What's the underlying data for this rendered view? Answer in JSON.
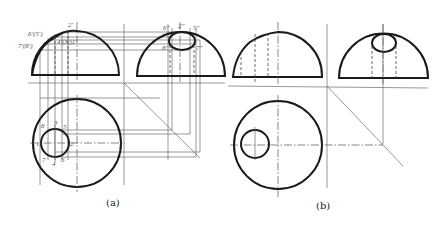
{
  "figure": {
    "panels": [
      {
        "id": "a",
        "caption": "(a)",
        "front_view_labels": [
          "6'(5')",
          "7'(8')",
          "2'",
          "4'",
          "3'",
          "1'"
        ],
        "side_view_labels": [
          "6\"",
          "2\"",
          "5\"",
          "7\"",
          "8\"",
          "4\"",
          "1\"",
          "3\""
        ],
        "top_view_labels": [
          "8",
          "3",
          "5",
          "1",
          "2",
          "7",
          "4",
          "6"
        ]
      },
      {
        "id": "b",
        "caption": "(b)"
      }
    ],
    "colors": {
      "outline": "#1a1a1a",
      "construction": "#6a6a6a",
      "background": "#ffffff"
    }
  }
}
